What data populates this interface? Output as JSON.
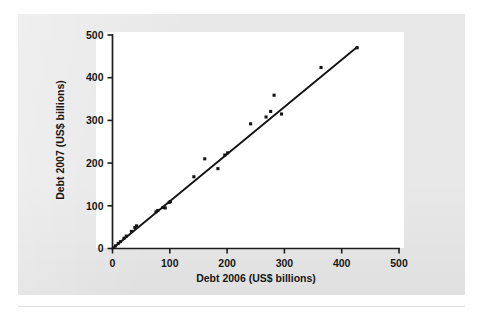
{
  "figure": {
    "name": "debt-2006-vs-2007-scatter",
    "background_color": "#e8e8e8",
    "plot_background_color": "#ffffff",
    "ink_color": "#141414"
  },
  "chart_data": {
    "type": "scatter",
    "title": "",
    "xlabel": "Debt 2006 (US$ billions)",
    "ylabel": "Debt 2007 (US$ billions)",
    "xlim": [
      0,
      500
    ],
    "ylim": [
      0,
      500
    ],
    "xticks": [
      0,
      100,
      200,
      300,
      400,
      500
    ],
    "yticks": [
      0,
      100,
      200,
      300,
      400,
      500
    ],
    "xticklabels": [
      "0",
      "100",
      "200",
      "300",
      "400",
      "500"
    ],
    "yticklabels": [
      "0",
      "100",
      "200",
      "300",
      "400",
      "500"
    ],
    "grid": false,
    "legend": false,
    "legend_position": "none",
    "series": [
      {
        "name": "Countries",
        "marker": "filled-square",
        "color": "#141414",
        "points": [
          [
            5,
            6
          ],
          [
            10,
            12
          ],
          [
            14,
            16
          ],
          [
            20,
            24
          ],
          [
            24,
            29
          ],
          [
            33,
            40
          ],
          [
            39,
            49
          ],
          [
            42,
            53
          ],
          [
            76,
            86
          ],
          [
            79,
            89
          ],
          [
            88,
            96
          ],
          [
            92,
            95
          ],
          [
            99,
            108
          ],
          [
            101,
            110
          ],
          [
            142,
            168
          ],
          [
            161,
            210
          ],
          [
            184,
            187
          ],
          [
            196,
            219
          ],
          [
            201,
            224
          ],
          [
            241,
            292
          ],
          [
            268,
            308
          ],
          [
            276,
            321
          ],
          [
            282,
            359
          ],
          [
            295,
            315
          ],
          [
            364,
            424
          ],
          [
            427,
            470
          ]
        ]
      }
    ],
    "fit_line": {
      "name": "Least-squares line",
      "color": "#141414",
      "x_start": 0,
      "y_start": 0,
      "x_end": 427,
      "y_end": 472,
      "slope": 1.105,
      "intercept": 0
    }
  }
}
